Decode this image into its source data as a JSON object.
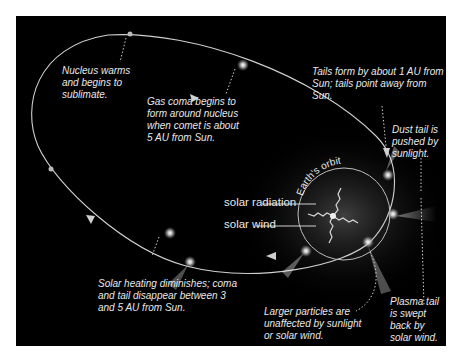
{
  "diagram": {
    "colors": {
      "background": "#000000",
      "frame": "#ffffff",
      "orbit_line": "#d0d0d0",
      "text": "#e8e8e8",
      "coma_glow": "#ffffff"
    },
    "annotations": {
      "nucleus_warms": [
        "Nucleus warms",
        "and begins to",
        "sublimate."
      ],
      "gas_coma": [
        "Gas coma begins to",
        "form around nucleus",
        "when comet is about",
        "5 AU from Sun."
      ],
      "tails_form": [
        "Tails form by about 1 AU from",
        "Sun; tails point away from Sun."
      ],
      "dust_tail": [
        "Dust tail is",
        "pushed by",
        "sunlight."
      ],
      "solar_heating": [
        "Solar heating diminishes; coma",
        "and tail disappear between 3",
        "and 5 AU from Sun."
      ],
      "larger_particles": [
        "Larger particles are",
        "unaffected by sunlight",
        "or solar wind."
      ],
      "plasma_tail": [
        "Plasma tail",
        "is swept",
        "back by",
        "solar wind."
      ]
    },
    "legend": {
      "solar_radiation": "solar radiation",
      "solar_wind": "solar wind"
    },
    "earth_orbit_label": "Earth's orbit"
  }
}
